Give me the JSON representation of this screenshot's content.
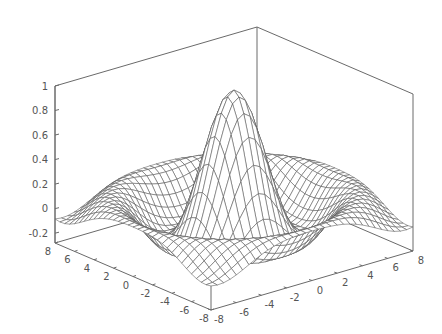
{
  "chart_data": {
    "type": "surface",
    "title": "",
    "function": "z = sin(sqrt(x^2 + y^2)) / sqrt(x^2 + y^2)",
    "xlabel": "",
    "ylabel": "",
    "zlabel": "",
    "x_range": [
      -8,
      8
    ],
    "y_range": [
      -8,
      8
    ],
    "z_range": [
      -0.28,
      1
    ],
    "grid_points": 33,
    "x_ticks": [
      -8,
      -6,
      -4,
      -2,
      0,
      2,
      4,
      6,
      8
    ],
    "y_ticks": [
      8,
      6,
      4,
      2,
      0,
      -2,
      -4,
      -6,
      -8
    ],
    "z_ticks": [
      -0.2,
      0,
      0.2,
      0.4,
      0.6,
      0.8,
      1
    ],
    "x_tick_labels": [
      "-8",
      "-6",
      "-4",
      "-2",
      "0",
      "2",
      "4",
      "6",
      "8"
    ],
    "y_tick_labels": [
      "8",
      "6",
      "4",
      "2",
      "0",
      "-2",
      "-4",
      "-6",
      "-8"
    ],
    "z_tick_labels": [
      "-0.2",
      "0",
      "0.2",
      "0.4",
      "0.6",
      "0.8",
      "1"
    ],
    "peak_value": 1,
    "grid": false,
    "legend": null,
    "style": "wireframe mesh, hidden surface, grayscale",
    "colors": {
      "mesh": "#555555",
      "box": "#6a6a6a",
      "text": "#555555",
      "background": "#ffffff"
    }
  }
}
